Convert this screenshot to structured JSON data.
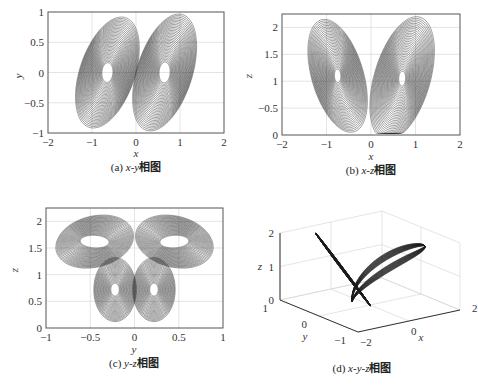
{
  "chart_data": [
    {
      "id": "a",
      "type": "line",
      "title": "(a) x-y相图",
      "caption_prefix": "(a) ",
      "caption_vars": "x-y",
      "caption_suffix": "相图",
      "xlabel": "x",
      "ylabel": "y",
      "xlim": [
        -2,
        2
      ],
      "ylim": [
        -1,
        1
      ],
      "xticks": [
        "-2",
        "-1",
        "0",
        "1",
        "2"
      ],
      "yticks": [
        "-1",
        "-0.5",
        "0",
        "0.5",
        "1"
      ],
      "grid": true,
      "description": "Double-scroll chaotic attractor projection, lobes centered near (-0.65, 0) and (0.65, 0); x range ≈ [-1.35, 1.35], y range ≈ [-0.95, 0.9]",
      "lobes": [
        {
          "cx": -0.65,
          "cy": 0.0,
          "rx_max": 0.7,
          "ry_max": 0.9
        },
        {
          "cx": 0.65,
          "cy": 0.0,
          "rx_max": 0.7,
          "ry_max": 0.95
        }
      ]
    },
    {
      "id": "b",
      "type": "line",
      "title": "(b) x-z相图",
      "caption_prefix": "(b) ",
      "caption_vars": "x-z",
      "caption_suffix": "相图",
      "xlabel": "x",
      "ylabel": "z",
      "xlim": [
        -2,
        2
      ],
      "ylim": [
        0,
        2.25
      ],
      "xticks": [
        "-2",
        "-1",
        "0",
        "1",
        "2"
      ],
      "yticks": [
        "0",
        "-0.5",
        "1",
        "1.5",
        "2"
      ],
      "ytick_values": [
        0,
        0.5,
        1,
        1.5,
        2
      ],
      "grid": true,
      "description": "Butterfly-shaped projection, lobes centered near (-0.75, 1.1) and (0.7, 1.05); z range ≈ [0.05, 2.25]",
      "lobes": [
        {
          "cx": -0.75,
          "cy": 1.1,
          "rx_max": 0.6,
          "ry_max": 1.05
        },
        {
          "cx": 0.7,
          "cy": 1.05,
          "rx_max": 0.65,
          "ry_max": 1.15
        }
      ]
    },
    {
      "id": "c",
      "type": "line",
      "title": "(c) y-z相图",
      "caption_prefix": "(c) ",
      "caption_vars": "y-z",
      "caption_suffix": "相图",
      "xlabel": "y",
      "ylabel": "z",
      "xlim": [
        -1,
        1
      ],
      "ylim": [
        0,
        2.25
      ],
      "xticks": [
        "-1",
        "-0.5",
        "0",
        "0.5",
        "1"
      ],
      "yticks": [
        "0",
        "0.5",
        "1",
        "1.5",
        "2"
      ],
      "grid": true,
      "description": "Butterfly-wing projection spanning y ≈ [-0.9, 0.85], z ≈ [0.05, 2.2], crossing near (0, 1.1)"
    },
    {
      "id": "d",
      "type": "line",
      "title": "(d) x-y-z相图",
      "caption_prefix": "(d) ",
      "caption_vars": "x-y-z",
      "caption_suffix": "相图",
      "xlabel": "x",
      "ylabel": "y",
      "zlabel": "z",
      "xticks": [
        "-2",
        "0",
        "2"
      ],
      "yticks": [
        "1",
        "0",
        "-1"
      ],
      "zticks": [
        "0",
        "1",
        "2"
      ],
      "grid": true,
      "projection": "3d",
      "description": "3D attractor view showing V-shaped structure, two wings meeting at base near z≈0"
    }
  ]
}
